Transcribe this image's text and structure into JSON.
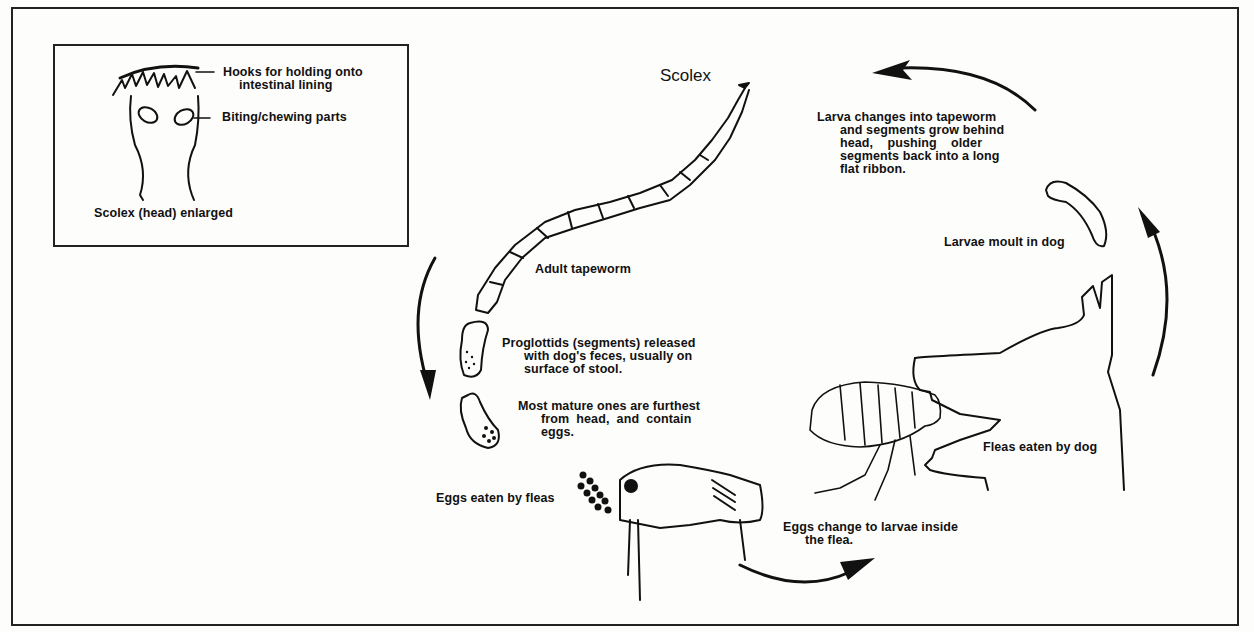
{
  "diagram": {
    "inset": {
      "hooks_label": "Hooks for holding onto",
      "hooks_label_2": "intestinal lining",
      "biting_label": "Biting/chewing parts",
      "caption": "Scolex (head) enlarged"
    },
    "scolex_label": "Scolex",
    "adult_label": "Adult tapeworm",
    "proglottids": {
      "line1": "Proglottids (segments) released",
      "line2": "with dog's feces, usually on",
      "line3": "surface of stool."
    },
    "mature": {
      "line1": "Most mature ones are furthest",
      "line2": "from  head,  and  contain",
      "line3": "eggs."
    },
    "eggs_eaten_label": "Eggs eaten by fleas",
    "eggs_change": {
      "line1": "Eggs change to larvae inside",
      "line2": "the flea."
    },
    "fleas_eaten_label": "Fleas eaten by dog",
    "larvae_moult_label": "Larvae moult in dog",
    "larva_changes": {
      "line1": "Larva changes into tapeworm",
      "line2": "and segments grow behind",
      "line3": "head,    pushing    older",
      "line4": "segments back into a long",
      "line5": "flat ribbon."
    },
    "colors": {
      "ink": "#111111",
      "paper": "#fdfdfb"
    }
  }
}
